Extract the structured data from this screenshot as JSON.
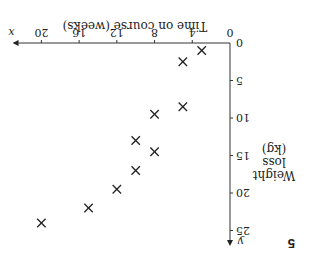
{
  "question_number": "5",
  "chart_data": {
    "type": "scatter",
    "title": "",
    "xlabel": "Time on course (weeks)",
    "ylabel": "Weight loss (kg)",
    "x_axis_letter": "x",
    "y_axis_letter": "y",
    "xlim": [
      0,
      22
    ],
    "ylim": [
      0,
      26
    ],
    "x_ticks": [
      0,
      4,
      8,
      12,
      16,
      20
    ],
    "y_ticks": [
      0,
      5,
      10,
      15,
      20,
      25
    ],
    "grid": false,
    "marker": "x",
    "points": [
      {
        "x": 3,
        "y": 1
      },
      {
        "x": 5,
        "y": 2.5
      },
      {
        "x": 5,
        "y": 8.5
      },
      {
        "x": 8,
        "y": 9.5
      },
      {
        "x": 10,
        "y": 13
      },
      {
        "x": 8,
        "y": 14.5
      },
      {
        "x": 10,
        "y": 17
      },
      {
        "x": 12,
        "y": 19.5
      },
      {
        "x": 15,
        "y": 22
      },
      {
        "x": 20,
        "y": 24
      }
    ],
    "orientation_note_rendered_rotated_180": true
  },
  "labels": {
    "ylabel_line1": "Weight",
    "ylabel_line2": "loss",
    "ylabel_line3": "(kg)"
  }
}
